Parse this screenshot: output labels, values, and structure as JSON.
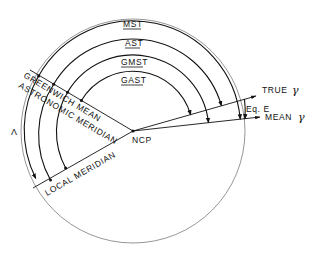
{
  "diagram": {
    "center_label": "NCP",
    "arcs": [
      {
        "label": "MST",
        "radius": 108
      },
      {
        "label": "AST",
        "radius": 92
      },
      {
        "label": "GMST",
        "radius": 76
      },
      {
        "label": "GAST",
        "radius": 60
      }
    ],
    "longitude_label": "Λ",
    "meridians": {
      "greenwich_line1": "GREENWICH MEAN",
      "greenwich_line2": "ASTRONOMIC MERIDIAN",
      "local": "LOCAL MERIDIAN"
    },
    "directions": {
      "true_equinox": "TRUE",
      "mean_equinox": "MEAN",
      "gamma": "γ"
    },
    "equation_label": "Eq. E",
    "colors": {
      "ink": "#111111",
      "circle": "#8a8a8a",
      "background": "#ffffff"
    }
  }
}
